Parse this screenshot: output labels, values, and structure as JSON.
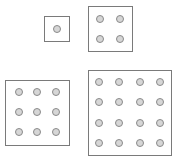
{
  "diagram": {
    "colors": {
      "box_border": "#7a7a7a",
      "dot_fill": "#d6d6d6",
      "dot_border": "#8a8a8a",
      "background": "#ffffff"
    },
    "figures": [
      {
        "label": "1x1",
        "count": 1,
        "box": {
          "x": 44,
          "y": 16,
          "w": 26,
          "h": 26
        },
        "cols": [
          57
        ],
        "rows": [
          29
        ]
      },
      {
        "label": "2x2",
        "count": 4,
        "box": {
          "x": 88,
          "y": 6,
          "w": 45,
          "h": 46
        },
        "cols": [
          100,
          120
        ],
        "rows": [
          19,
          39
        ]
      },
      {
        "label": "3x3",
        "count": 9,
        "box": {
          "x": 5,
          "y": 80,
          "w": 65,
          "h": 66
        },
        "cols": [
          19,
          37,
          56
        ],
        "rows": [
          92,
          112,
          132
        ]
      },
      {
        "label": "4x4",
        "count": 16,
        "box": {
          "x": 88,
          "y": 70,
          "w": 84,
          "h": 86
        },
        "cols": [
          99,
          119,
          140,
          160
        ],
        "rows": [
          82,
          102,
          123,
          143
        ]
      }
    ]
  }
}
